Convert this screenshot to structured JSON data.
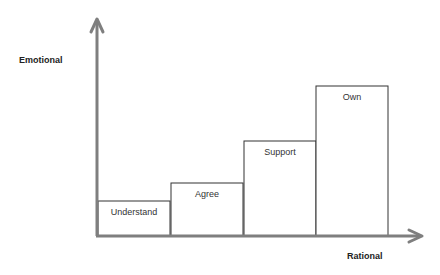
{
  "axes": {
    "y_label": "Emotional",
    "x_label": "Rational",
    "color": "#7f7f7f"
  },
  "bars": [
    {
      "label": "Understand",
      "x": 98,
      "width": 72,
      "top": 201
    },
    {
      "label": "Agree",
      "x": 171,
      "width": 72,
      "top": 183
    },
    {
      "label": "Support",
      "x": 244,
      "width": 72,
      "top": 141
    },
    {
      "label": "Own",
      "x": 316,
      "width": 72,
      "top": 86
    }
  ],
  "chart_data": {
    "type": "bar",
    "categories": [
      "Understand",
      "Agree",
      "Support",
      "Own"
    ],
    "values": [
      1,
      1.5,
      2.7,
      4.1
    ],
    "title": "",
    "xlabel": "Rational",
    "ylabel": "Emotional"
  }
}
